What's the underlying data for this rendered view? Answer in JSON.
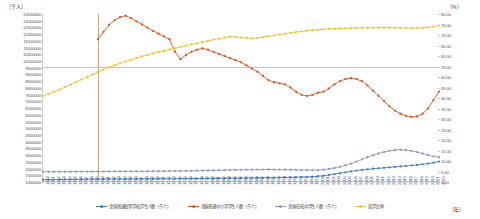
{
  "axes": {
    "left_unit": "（千人）",
    "right_unit": "（%）",
    "x_unit": "（年）"
  },
  "chart_data": {
    "type": "line",
    "title": "",
    "xlabel": "（年）",
    "ylabel": "（千人）",
    "y2label": "（%）",
    "grid": false,
    "legend_position": "bottom",
    "ylim": [
      1000000,
      13500000
    ],
    "y2lim": [
      0,
      80
    ],
    "yticks": [
      13500000,
      13000000,
      12500000,
      12000000,
      11500000,
      11000000,
      10500000,
      10000000,
      9500000,
      9000000,
      8500000,
      8000000,
      7500000,
      7000000,
      6500000,
      6000000,
      5500000,
      5000000,
      4500000,
      4000000,
      3500000,
      3000000,
      2500000,
      2000000,
      1500000,
      1000000
    ],
    "y2ticks": [
      "80.00",
      "75.00",
      "70.00",
      "65.00",
      "60.00",
      "55.00",
      "50.00",
      "45.00",
      "40.00",
      "35.00",
      "30.00",
      "25.00",
      "20.00",
      "15.00",
      "10.00",
      "5.00",
      "0.00"
    ],
    "reference_lines": {
      "vertical_year": "1960",
      "horizontal_y2": 55.0
    },
    "categories": [
      "1950",
      "1951",
      "1952",
      "1953",
      "1954",
      "1955",
      "1956",
      "1957",
      "1958",
      "1959",
      "1960",
      "1961",
      "1962",
      "1963",
      "1964",
      "1965",
      "1966",
      "1967",
      "1968",
      "1969",
      "1970",
      "1971",
      "1972",
      "1973",
      "1974",
      "1975",
      "1976",
      "1977",
      "1978",
      "1979",
      "1980",
      "1981",
      "1982",
      "1983",
      "1984",
      "1985",
      "1986",
      "1987",
      "1988",
      "1989",
      "1990",
      "1991",
      "1992",
      "1993",
      "1994",
      "1995",
      "1996",
      "1997",
      "1998",
      "1999",
      "2000",
      "2001",
      "2002",
      "2003",
      "2004",
      "2005",
      "2006",
      "2007",
      "2008",
      "2009",
      "2010",
      "2011",
      "2012",
      "2013",
      "2014",
      "2015",
      "2016",
      "2017",
      "2018",
      "2019",
      "2020",
      "2021",
      "2022"
    ],
    "series": [
      {
        "name": "全国普通高等学校学生人数（千人）",
        "key": "university",
        "color": "#4A7EBB",
        "axis": "left",
        "values": [
          1170000,
          1175000,
          1180000,
          1185000,
          1190000,
          1195000,
          1200000,
          1205000,
          1210000,
          1215000,
          1220000,
          1222000,
          1224000,
          1226000,
          1228000,
          1230000,
          1232000,
          1234000,
          1236000,
          1238000,
          1240000,
          1242000,
          1244000,
          1246000,
          1248000,
          1250000,
          1252000,
          1254000,
          1258000,
          1262000,
          1266000,
          1270000,
          1274000,
          1278000,
          1282000,
          1286000,
          1290000,
          1294000,
          1298000,
          1302000,
          1306000,
          1312000,
          1318000,
          1326000,
          1334000,
          1344000,
          1354000,
          1366000,
          1380000,
          1400000,
          1430000,
          1470000,
          1520000,
          1580000,
          1650000,
          1720000,
          1790000,
          1850000,
          1900000,
          1945000,
          1985000,
          2020000,
          2055000,
          2090000,
          2125000,
          2160000,
          2195000,
          2230000,
          2270000,
          2315000,
          2370000,
          2440000,
          2520000
        ]
      },
      {
        "name": "全国普通中小学学生人数（千人）",
        "key": "primary_secondary",
        "color": "#D9541E",
        "axis": "right",
        "values": [
          null,
          null,
          null,
          null,
          null,
          null,
          null,
          null,
          null,
          null,
          68.0,
          71.5,
          74.8,
          77.0,
          78.5,
          79.2,
          78.0,
          76.5,
          75.0,
          73.5,
          72.0,
          70.6,
          69.3,
          68.0,
          62.0,
          58.5,
          60.5,
          62.0,
          63.0,
          63.6,
          63.0,
          62.0,
          61.0,
          60.0,
          59.0,
          58.0,
          57.0,
          55.5,
          54.0,
          52.5,
          50.5,
          48.5,
          47.5,
          47.0,
          46.5,
          45.0,
          43.0,
          41.5,
          41.0,
          41.5,
          42.5,
          43.0,
          44.5,
          46.5,
          48.0,
          49.0,
          49.5,
          49.0,
          48.0,
          46.0,
          43.5,
          41.0,
          38.5,
          36.0,
          34.0,
          32.5,
          31.5,
          31.0,
          31.2,
          32.5,
          35.0,
          39.0,
          43.0
        ]
      },
      {
        "name": "全国在校中学生人数（千人）",
        "key": "secondary",
        "color": "#8C9CB5",
        "axis": "left",
        "values": [
          1760000,
          1762000,
          1764000,
          1766000,
          1768000,
          1770000,
          1772000,
          1774000,
          1776000,
          1778000,
          1780000,
          1782000,
          1784000,
          1786000,
          1788000,
          1790000,
          1792000,
          1794000,
          1796000,
          1798000,
          1800000,
          1804000,
          1808000,
          1812000,
          1816000,
          1820000,
          1826000,
          1832000,
          1840000,
          1848000,
          1856000,
          1864000,
          1872000,
          1880000,
          1888000,
          1896000,
          1904000,
          1912000,
          1918000,
          1924000,
          1928000,
          1930000,
          1928000,
          1924000,
          1918000,
          1910000,
          1900000,
          1890000,
          1882000,
          1880000,
          1890000,
          1920000,
          1970000,
          2040000,
          2130000,
          2240000,
          2370000,
          2520000,
          2680000,
          2840000,
          2990000,
          3120000,
          3230000,
          3320000,
          3380000,
          3400000,
          3380000,
          3320000,
          3230000,
          3120000,
          3000000,
          2900000,
          2840000
        ]
      },
      {
        "name": "就学比率",
        "key": "enrollment_rate",
        "color": "#F2C230",
        "axis": "right",
        "values": [
          41.0,
          42.0,
          43.0,
          44.0,
          45.2,
          46.4,
          47.6,
          48.8,
          50.0,
          51.2,
          52.4,
          53.5,
          54.6,
          55.6,
          56.5,
          57.4,
          58.2,
          59.0,
          59.8,
          60.5,
          61.2,
          61.9,
          62.5,
          63.1,
          63.7,
          64.3,
          64.9,
          65.5,
          66.0,
          66.6,
          67.2,
          67.8,
          68.3,
          68.8,
          69.2,
          69.0,
          68.8,
          68.6,
          68.4,
          68.6,
          69.0,
          69.4,
          69.8,
          70.2,
          70.6,
          71.0,
          71.4,
          71.7,
          72.0,
          72.3,
          72.5,
          72.7,
          72.9,
          73.0,
          73.1,
          73.2,
          73.3,
          73.4,
          73.4,
          73.5,
          73.5,
          73.5,
          73.5,
          73.5,
          73.5,
          73.4,
          73.4,
          73.3,
          73.3,
          73.4,
          73.6,
          74.0,
          74.5
        ]
      }
    ]
  },
  "legend": [
    {
      "label": "全国普通高等学校学生人数（千人）",
      "color": "#4A7EBB"
    },
    {
      "label": "全国普通中小学学生人数（千人）",
      "color": "#D9541E"
    },
    {
      "label": "全国在校中学生人数（千人）",
      "color": "#8C9CB5"
    },
    {
      "label": "就学比率",
      "color": "#F2C230"
    }
  ]
}
